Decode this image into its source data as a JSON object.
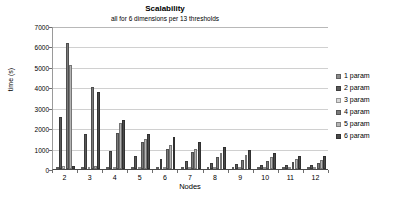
{
  "chart_data": {
    "type": "bar",
    "title": "Scalability",
    "subtitle": "all for 6 dimensions per 13 thresholds",
    "xlabel": "Nodes",
    "ylabel": "time (s)",
    "ylim": [
      0,
      7000
    ],
    "ytick_step": 1000,
    "yticks": [
      "7000",
      "6000",
      "5000",
      "4000",
      "3000",
      "2000",
      "1000",
      "0"
    ],
    "ytick_values": [
      7000,
      6000,
      5000,
      4000,
      3000,
      2000,
      1000,
      0
    ],
    "grid": true,
    "legend_position": "right",
    "categories": [
      "2",
      "3",
      "4",
      "5",
      "6",
      "7",
      "8",
      "9",
      "10",
      "11",
      "12"
    ],
    "series": [
      {
        "name": "1 param",
        "color": "#8c8c8c",
        "values": [
          120,
          95,
          75,
          60,
          48,
          42,
          35,
          30,
          26,
          22,
          20
        ]
      },
      {
        "name": "2 param",
        "color": "#595959",
        "values": [
          2560,
          1700,
          860,
          650,
          470,
          410,
          300,
          260,
          215,
          185,
          175
        ]
      },
      {
        "name": "3 param",
        "color": "#d9d9d9",
        "values": [
          130,
          110,
          90,
          70,
          55,
          48,
          40,
          34,
          28,
          24,
          22
        ]
      },
      {
        "name": "4 param",
        "color": "#7a7a7a",
        "values": [
          6190,
          4010,
          1740,
          1340,
          1000,
          840,
          590,
          420,
          380,
          330,
          300
        ]
      },
      {
        "name": "5 param",
        "color": "#b5b5b5",
        "values": [
          5080,
          150,
          2270,
          1450,
          1200,
          960,
          760,
          690,
          570,
          480,
          450
        ]
      },
      {
        "name": "6 param",
        "color": "#4a4a4a",
        "values": [
          130,
          3760,
          2400,
          1690,
          1560,
          1340,
          1060,
          920,
          790,
          650,
          620
        ]
      }
    ]
  },
  "legend": {
    "items": [
      {
        "label": "1 param",
        "color": "#8c8c8c"
      },
      {
        "label": "2 param",
        "color": "#595959"
      },
      {
        "label": "3 param",
        "color": "#d9d9d9"
      },
      {
        "label": "4 param",
        "color": "#7a7a7a"
      },
      {
        "label": "5 param",
        "color": "#b5b5b5"
      },
      {
        "label": "6 param",
        "color": "#4a4a4a"
      }
    ]
  }
}
